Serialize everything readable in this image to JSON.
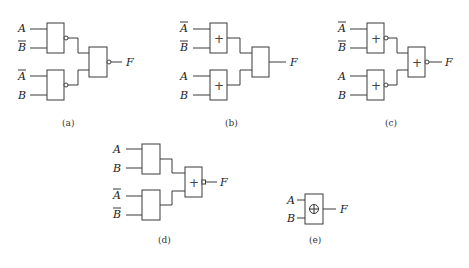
{
  "diagrams": [
    {
      "id": "a",
      "caption": "(a)",
      "inputs": [
        "A",
        "B̄",
        "Ā",
        "B"
      ],
      "input_bars": [
        false,
        true,
        true,
        false
      ],
      "gate1_symbol": "",
      "gate2_symbol": "",
      "output_gate_symbol": "",
      "gate1_inverted": true,
      "gate2_inverted": true,
      "output_inverted": true,
      "output": "F"
    },
    {
      "id": "b",
      "caption": "(b)",
      "inputs": [
        "Ā",
        "B̄",
        "A",
        "B"
      ],
      "input_bars": [
        true,
        true,
        false,
        false
      ],
      "gate1_symbol": "+",
      "gate2_symbol": "+",
      "output_gate_symbol": "",
      "gate1_inverted": false,
      "gate2_inverted": false,
      "output_inverted": false,
      "output": "F"
    },
    {
      "id": "c",
      "caption": "(c)",
      "inputs": [
        "Ā",
        "B̄",
        "A",
        "B"
      ],
      "input_bars": [
        true,
        true,
        false,
        false
      ],
      "gate1_symbol": "+",
      "gate2_symbol": "+",
      "output_gate_symbol": "+",
      "gate1_inverted": true,
      "gate2_inverted": true,
      "output_inverted": true,
      "output": "F"
    },
    {
      "id": "d",
      "caption": "(d)",
      "inputs": [
        "A",
        "B",
        "Ā",
        "B̄"
      ],
      "input_bars": [
        false,
        false,
        true,
        true
      ],
      "gate1_symbol": "",
      "gate2_symbol": "",
      "output_gate_symbol": "+",
      "gate1_inverted": false,
      "gate2_inverted": false,
      "output_inverted": true,
      "output": "F"
    },
    {
      "id": "e",
      "caption": "(e)",
      "inputs": [
        "A",
        "B"
      ],
      "input_bars": [
        false,
        false
      ],
      "gate_symbol": "⊕",
      "output": "F"
    }
  ],
  "labels": {
    "a": {
      "in1": "A",
      "in2": "B",
      "in3": "A",
      "in4": "B",
      "out": "F",
      "caption": "(a)"
    },
    "b": {
      "in1": "A",
      "in2": "B",
      "in3": "A",
      "in4": "B",
      "out": "F",
      "caption": "(b)",
      "g1": "+",
      "g2": "+"
    },
    "c": {
      "in1": "A",
      "in2": "B",
      "in3": "A",
      "in4": "B",
      "out": "F",
      "caption": "(c)",
      "g1": "+",
      "g2": "+",
      "g3": "+"
    },
    "d": {
      "in1": "A",
      "in2": "B",
      "in3": "A",
      "in4": "B",
      "out": "F",
      "caption": "(d)",
      "g3": "+"
    },
    "e": {
      "in1": "A",
      "in2": "B",
      "out": "F",
      "caption": "(e)",
      "g": "⊕"
    }
  }
}
